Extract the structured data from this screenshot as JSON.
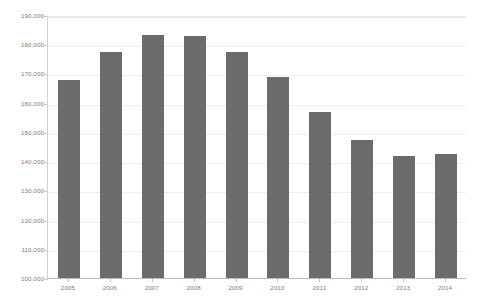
{
  "chart_data": {
    "type": "bar",
    "title": "",
    "subtitle": "",
    "xlabel": "",
    "ylabel": "",
    "categories": [
      "2005",
      "2006",
      "2007",
      "2008",
      "2009",
      "2010",
      "2011",
      "2012",
      "2013",
      "2014"
    ],
    "values": [
      167800,
      177500,
      183000,
      182800,
      177400,
      168700,
      156700,
      147300,
      141600,
      142300
    ],
    "series": [
      {
        "name": "",
        "values": [
          167800,
          177500,
          183000,
          182800,
          177400,
          168700,
          156700,
          147300,
          141600,
          142300
        ]
      }
    ],
    "ylim": [
      100000,
      190000
    ],
    "ytick_step": 10000,
    "ytick_labels": [
      "190,000",
      "180,000",
      "170,000",
      "160,000",
      "150,000",
      "140,000",
      "130,000",
      "120,000",
      "110,000",
      "100,000"
    ],
    "ytick_values": [
      190000,
      180000,
      170000,
      160000,
      150000,
      140000,
      130000,
      120000,
      110000,
      100000
    ],
    "grid": true,
    "legend": false,
    "legend_position": "none",
    "bar_color": "#6b6b6b",
    "gridline_color": "#ededed",
    "axis_color": "#b9b9b9",
    "tick_label_color": "#7d7d7d",
    "background_color": "#ffffff",
    "annotations": []
  }
}
